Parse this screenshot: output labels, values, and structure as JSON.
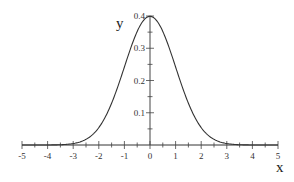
{
  "chart_data": {
    "type": "line",
    "title": "",
    "xlabel": "x",
    "ylabel": "y",
    "xlim": [
      -5,
      5
    ],
    "ylim": [
      0,
      0.4
    ],
    "grid": false,
    "legend": null,
    "x_ticks": [
      "-5",
      "-4",
      "-3",
      "-2",
      "-1",
      "0",
      "1",
      "2",
      "3",
      "4",
      "5"
    ],
    "y_ticks": [
      "0.1",
      "0.2",
      "0.3",
      "0.4"
    ],
    "series": [
      {
        "name": "standard normal density",
        "x": [
          -5,
          -4,
          -3.5,
          -3,
          -2.5,
          -2,
          -1.5,
          -1,
          -0.5,
          0,
          0.5,
          1,
          1.5,
          2,
          2.5,
          3,
          3.5,
          4,
          5
        ],
        "y": [
          1.5e-06,
          0.0001,
          0.0009,
          0.0044,
          0.0175,
          0.054,
          0.1295,
          0.242,
          0.3521,
          0.3989,
          0.3521,
          0.242,
          0.1295,
          0.054,
          0.0175,
          0.0044,
          0.0009,
          0.0001,
          1.5e-06
        ]
      }
    ]
  }
}
